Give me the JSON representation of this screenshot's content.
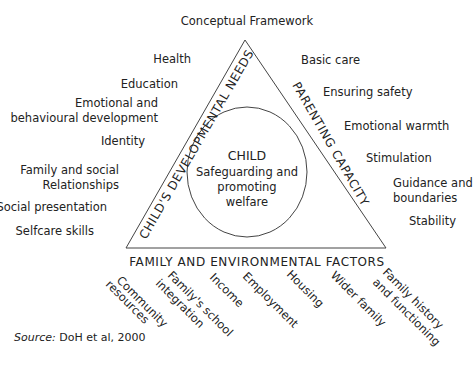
{
  "title": "Conceptual Framework",
  "center": {
    "title": "CHILD",
    "line1": "Safeguarding and",
    "line2": "promoting",
    "line3": "welfare"
  },
  "sides": {
    "left": "CHILD'S DEVELOPMENTAL NEEDS",
    "right": "PARENTING CAPACITY",
    "bottom": "FAMILY AND ENVIRONMENTAL FACTORS"
  },
  "developmental_needs": [
    [
      "Health"
    ],
    [
      "Education"
    ],
    [
      "Emotional and",
      "behavioural development"
    ],
    [
      "Identity"
    ],
    [
      "Family and social",
      "Relationships"
    ],
    [
      "Social presentation"
    ],
    [
      "Selfcare skills"
    ]
  ],
  "parenting_capacity": [
    [
      "Basic care"
    ],
    [
      "Ensuring safety"
    ],
    [
      "Emotional warmth"
    ],
    [
      "Stimulation"
    ],
    [
      "Guidance and",
      "boundaries"
    ],
    [
      "Stability"
    ]
  ],
  "family_factors": [
    [
      "Community",
      "resources"
    ],
    [
      "Family's school",
      "integration"
    ],
    [
      "Income"
    ],
    [
      "Employment"
    ],
    [
      "Housing"
    ],
    [
      "Wider family"
    ],
    [
      "Family history",
      "and functioning"
    ]
  ],
  "source": {
    "label": "Source:",
    "text": " DoH et al, 2000"
  }
}
